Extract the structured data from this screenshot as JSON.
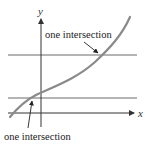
{
  "diagram": {
    "axes": {
      "x_label": "x",
      "y_label": "y"
    },
    "annotations": [
      {
        "id": "upper",
        "text": "one intersection"
      },
      {
        "id": "lower",
        "text": "one intersection"
      }
    ],
    "colors": {
      "curve": "#8a8a8a",
      "lines": "#6a6a6a",
      "axes": "#333333",
      "text": "#222222"
    }
  }
}
